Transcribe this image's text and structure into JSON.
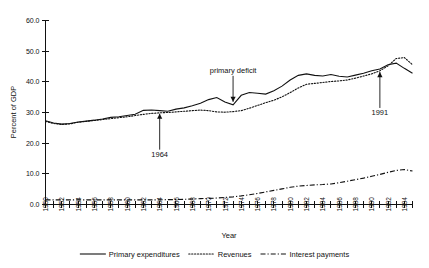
{
  "chart_data": {
    "type": "line",
    "title": "",
    "xlabel": "Year",
    "ylabel": "Percent of GDP",
    "xlim": [
      1950,
      1995
    ],
    "ylim": [
      0.0,
      60.0
    ],
    "grid": false,
    "legend_position": "bottom",
    "y_ticks": [
      "0.0",
      "10.0",
      "20.0",
      "30.0",
      "40.0",
      "50.0",
      "60.0"
    ],
    "y_tick_values": [
      0.0,
      10.0,
      20.0,
      30.0,
      40.0,
      50.0,
      60.0
    ],
    "x_tick_labels": [
      "1950",
      "1952",
      "1954",
      "1956",
      "1958",
      "1960",
      "1962",
      "1964",
      "1966",
      "1968",
      "1970",
      "1972",
      "1974",
      "1976",
      "1978",
      "1980",
      "1982",
      "1984",
      "1986",
      "1988",
      "1990",
      "1992",
      "1994"
    ],
    "x_minor_years": [
      1950,
      1951,
      1952,
      1953,
      1954,
      1955,
      1956,
      1957,
      1958,
      1959,
      1960,
      1961,
      1962,
      1963,
      1964,
      1965,
      1966,
      1967,
      1968,
      1969,
      1970,
      1971,
      1972,
      1973,
      1974,
      1975,
      1976,
      1977,
      1978,
      1979,
      1980,
      1981,
      1982,
      1983,
      1984,
      1985,
      1986,
      1987,
      1988,
      1989,
      1990,
      1991,
      1992,
      1993,
      1994,
      1995
    ],
    "x": [
      1950,
      1951,
      1952,
      1953,
      1954,
      1955,
      1956,
      1957,
      1958,
      1959,
      1960,
      1961,
      1962,
      1963,
      1964,
      1965,
      1966,
      1967,
      1968,
      1969,
      1970,
      1971,
      1972,
      1973,
      1974,
      1975,
      1976,
      1977,
      1978,
      1979,
      1980,
      1981,
      1982,
      1983,
      1984,
      1985,
      1986,
      1987,
      1988,
      1989,
      1990,
      1991,
      1992,
      1993,
      1994,
      1995
    ],
    "series": [
      {
        "name": "Primary expenditures",
        "style": "solid",
        "values": [
          27.3,
          26.6,
          26.2,
          26.4,
          26.9,
          27.2,
          27.5,
          27.9,
          28.4,
          28.6,
          29.0,
          29.4,
          30.7,
          30.8,
          30.6,
          30.4,
          31.1,
          31.5,
          32.2,
          33.0,
          34.2,
          34.9,
          33.4,
          32.5,
          35.6,
          36.5,
          36.3,
          36.0,
          37.1,
          38.6,
          40.6,
          42.1,
          42.6,
          42.1,
          41.9,
          42.4,
          41.8,
          41.6,
          42.2,
          42.8,
          43.6,
          44.2,
          45.6,
          46.1,
          44.4,
          42.8
        ]
      },
      {
        "name": "Revenues",
        "style": "dotted",
        "values": [
          27.1,
          26.4,
          26.1,
          26.3,
          26.8,
          27.1,
          27.4,
          27.7,
          28.0,
          28.3,
          28.6,
          29.0,
          29.4,
          29.7,
          29.9,
          30.0,
          30.2,
          30.4,
          30.6,
          30.8,
          30.6,
          30.2,
          30.1,
          30.3,
          30.6,
          31.4,
          32.3,
          33.2,
          34.0,
          35.1,
          36.5,
          38.0,
          39.2,
          39.5,
          39.8,
          40.1,
          40.3,
          40.6,
          41.2,
          41.9,
          42.6,
          43.6,
          45.2,
          47.6,
          47.9,
          45.6
        ]
      },
      {
        "name": "Interest payments",
        "style": "dash-dot",
        "values": [
          1.5,
          1.5,
          1.5,
          1.5,
          1.5,
          1.5,
          1.5,
          1.5,
          1.5,
          1.5,
          1.5,
          1.5,
          1.5,
          1.5,
          1.5,
          1.6,
          1.6,
          1.7,
          1.8,
          1.9,
          2.0,
          2.1,
          2.3,
          2.5,
          2.8,
          3.2,
          3.6,
          4.1,
          4.6,
          5.1,
          5.6,
          6.0,
          6.2,
          6.4,
          6.5,
          6.7,
          7.1,
          7.6,
          8.1,
          8.6,
          9.2,
          9.8,
          10.5,
          11.1,
          11.4,
          10.9
        ]
      }
    ],
    "annotations": [
      {
        "text": "1964",
        "year": 1964,
        "value": 30.6,
        "direction": "up"
      },
      {
        "text": "primary deficit",
        "year": 1973,
        "value": 32.5,
        "direction": "down"
      },
      {
        "text": "1991",
        "year": 1991,
        "value": 44.2,
        "direction": "up"
      }
    ]
  },
  "legend": {
    "items": [
      {
        "label": "Primary expenditures",
        "style": "solid"
      },
      {
        "label": "Revenues",
        "style": "dotted"
      },
      {
        "label": "Interest payments",
        "style": "dash-dot"
      }
    ]
  }
}
